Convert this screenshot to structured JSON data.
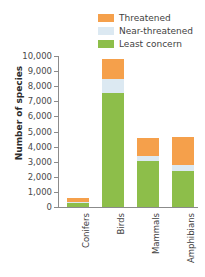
{
  "chart_data": {
    "type": "bar",
    "stacked": true,
    "title": "",
    "xlabel": "",
    "ylabel": "Number of species",
    "ylim": [
      0,
      10000
    ],
    "ytick_step": 1000,
    "ytick_labels": [
      "10,000",
      "9,000",
      "8,000",
      "7,000",
      "6,000",
      "5,000",
      "4,000",
      "3,000",
      "2,000",
      "1,000",
      "0"
    ],
    "ytick_values": [
      10000,
      9000,
      8000,
      7000,
      6000,
      5000,
      4000,
      3000,
      2000,
      1000,
      0
    ],
    "grid": false,
    "legend_position": "top-right",
    "categories": [
      "Conifers",
      "Birds",
      "Mammals",
      "Amphibians"
    ],
    "series": [
      {
        "name": "Least concern",
        "color": "#8DBE4A",
        "values": [
          240,
          7550,
          3050,
          2380
        ]
      },
      {
        "name": "Near-threatened",
        "color": "#DCE9F2",
        "values": [
          80,
          950,
          300,
          370
        ]
      },
      {
        "name": "Threatened",
        "color": "#F5A04B",
        "values": [
          280,
          1300,
          1200,
          1900
        ]
      }
    ],
    "totals": [
      600,
      9800,
      4550,
      4650
    ]
  },
  "legend": {
    "items": [
      {
        "label": "Threatened",
        "color": "#F5A04B"
      },
      {
        "label": "Near-threatened",
        "color": "#DCE9F2"
      },
      {
        "label": "Least concern",
        "color": "#8DBE4A"
      }
    ]
  },
  "axis": {
    "y_title": "Number of species"
  }
}
